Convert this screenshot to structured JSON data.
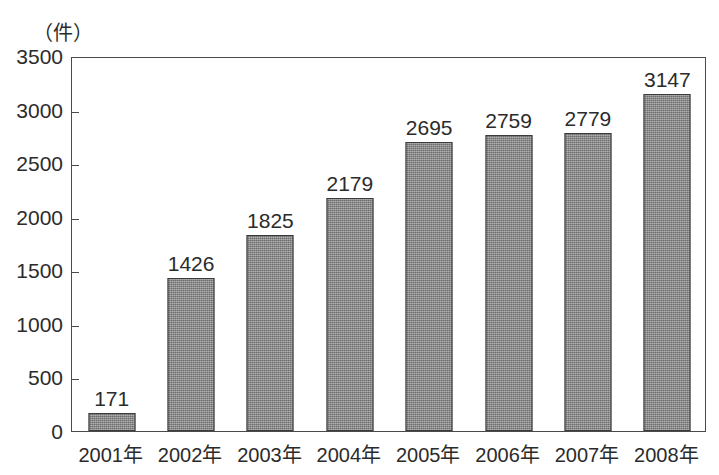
{
  "chart_data": {
    "type": "bar",
    "title": "",
    "subtitle": "",
    "xlabel": "",
    "ylabel": "（件）",
    "unit_label": "（件）",
    "categories": [
      "2001年",
      "2002年",
      "2003年",
      "2004年",
      "2005年",
      "2006年",
      "2007年",
      "2008年"
    ],
    "values": [
      171,
      1426,
      1825,
      2179,
      2695,
      2759,
      2779,
      3147
    ],
    "value_labels": [
      "171",
      "1426",
      "1825",
      "2179",
      "2695",
      "2759",
      "2779",
      "3147"
    ],
    "ylim": [
      0,
      3500
    ],
    "ytick_values": [
      0,
      500,
      1000,
      1500,
      2000,
      2500,
      3000,
      3500
    ],
    "ytick_labels": [
      "0",
      "500",
      "1000",
      "1500",
      "2000",
      "2500",
      "3000",
      "3500"
    ],
    "grid": false,
    "legend": null,
    "legend_position": "none",
    "bar_fill_color": "#838383",
    "bar_border_color": "#3b3b3b",
    "axis_color": "#4a4a4a",
    "background_color": "#ffffff",
    "text_color": "#2b2b2b",
    "data_labels_shown": true
  }
}
